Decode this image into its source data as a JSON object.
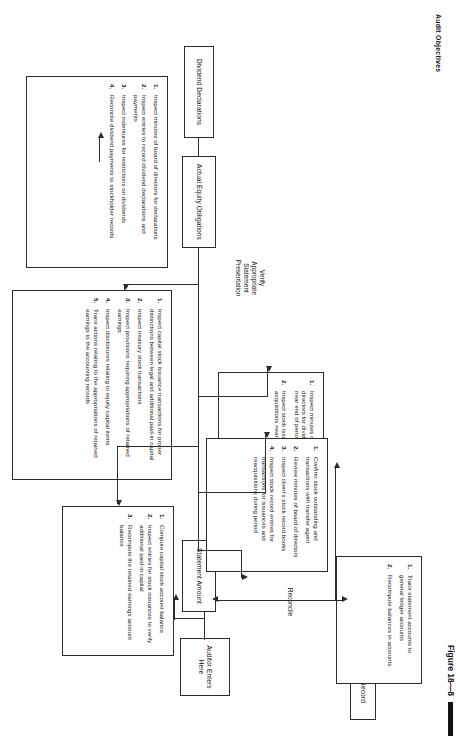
{
  "figure": {
    "title": "Audit Objectives",
    "caption": "Figure 18—8"
  },
  "spine_labels": [
    {
      "id": "verify-existence",
      "text": "Verify\nExistence"
    },
    {
      "id": "verify-valuation",
      "text": "Verify\nValuation"
    },
    {
      "id": "verify-cutoff",
      "text": "Verify\nCutoff"
    },
    {
      "id": "verify-presentation",
      "text": "Verify\nAppropriate\nStatement\nPresentation"
    }
  ],
  "terminals": [
    {
      "id": "record",
      "text": "Record"
    },
    {
      "id": "auditor-enters-here",
      "text": "Auditor\nEnters\nHere"
    },
    {
      "id": "reconcile",
      "text": "Reconcile"
    },
    {
      "id": "statement-amount",
      "text": "Statement\nAmount"
    },
    {
      "id": "actual-equity-obligations",
      "text": "Actual\nEquity\nObligations"
    },
    {
      "id": "dividend-declarations",
      "text": "Dividend\nDeclarations"
    }
  ],
  "procedure_boxes": [
    {
      "id": "reconcile-procedures",
      "items": [
        "Trace statement accounts to general ledger accounts",
        "Recompute balances in accounts"
      ]
    },
    {
      "id": "existence-procedures",
      "items": [
        "Confirm stock outstanding and transactions with transfer agent",
        "Review minutes of board of directors",
        "Inspect client's stock record books",
        "Inspect stock record entries for transactions for issuances and reacquisitions during period"
      ]
    },
    {
      "id": "valuation-procedures",
      "items": [
        "Compute capital stock account balance",
        "Inspect entries for stock issuances to verify additional paid-in capital",
        "Recompute the retained earnings account balance"
      ]
    },
    {
      "id": "cutoff-procedures",
      "items": [
        "Inspect minutes of board of directors for dividend declarations near end of period",
        "Inspect stock issuances and acquisitions near end of period"
      ]
    },
    {
      "id": "presentation-procedures",
      "items": [
        "Inspect capital stock issuance transactions for proper distinctions between legal and additional paid-in capital",
        "Inspect treasury stock transactions",
        "Inspect provisions requiring appropriations of retained earnings",
        "Inspect disclosures relating to equity capital items",
        "Trace actions relating to the appropriations of retained earnings to the accounting records"
      ]
    },
    {
      "id": "dividend-procedures",
      "items": [
        "Inspect minutes of board of directors for declarations",
        "Inspect entries to record dividend declarations and payments",
        "Inspect indentures for restrictions on dividends",
        "Reconcile dividend payments to stockholder records"
      ]
    }
  ],
  "colors": {
    "ink": "#2b2b2b",
    "paper": "#ffffff"
  }
}
